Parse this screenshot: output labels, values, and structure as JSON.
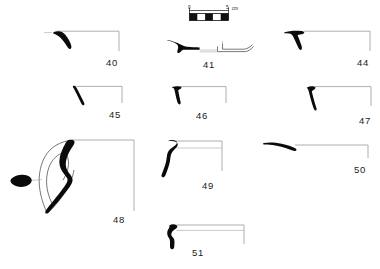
{
  "plate": {
    "title": "Ceramic profile plate",
    "background_color": "#ffffff",
    "profile_color": "#0a0a0a",
    "axis_color": "#9a9a9a",
    "outline_color": "#3c3c3c"
  },
  "scale_bar": {
    "name": "scale-bar",
    "start_label": "0",
    "end_label": "5",
    "unit_label": "cm",
    "segments": 5,
    "length_cm": 5
  },
  "figures": [
    {
      "id": "40",
      "label": "40",
      "caption_position": "right"
    },
    {
      "id": "41",
      "label": "41",
      "caption_position": "below"
    },
    {
      "id": "44",
      "label": "44",
      "caption_position": "right"
    },
    {
      "id": "45",
      "label": "45",
      "caption_position": "right"
    },
    {
      "id": "46",
      "label": "46",
      "caption_position": "below"
    },
    {
      "id": "47",
      "label": "47",
      "caption_position": "right"
    },
    {
      "id": "48",
      "label": "48",
      "caption_position": "right"
    },
    {
      "id": "49",
      "label": "49",
      "caption_position": "below"
    },
    {
      "id": "50",
      "label": "50",
      "caption_position": "right"
    },
    {
      "id": "51",
      "label": "51",
      "caption_position": "below"
    }
  ]
}
